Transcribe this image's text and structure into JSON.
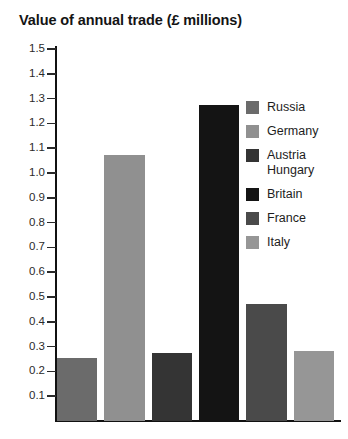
{
  "chart_data": {
    "type": "bar",
    "title": "Value of annual trade (£ millions)",
    "xlabel": "",
    "ylabel": "",
    "ylim": [
      0,
      1.5
    ],
    "ytick_step": 0.1,
    "grid": false,
    "legend_position": "right",
    "categories": [
      "Russia",
      "Germany",
      "Austria Hungary",
      "Britain",
      "France",
      "Italy"
    ],
    "values": [
      0.18,
      1.0,
      0.2,
      1.2,
      0.4,
      0.21
    ],
    "ytick_labels": [
      "1.5",
      "1.4",
      "1.3",
      "1.2",
      "1.1",
      "1.0",
      "0.9",
      "0.8",
      "0.7",
      "0.6",
      "0.5",
      "0.4",
      "0.3",
      "0.2",
      "0.1"
    ],
    "colors": [
      "#6b6b6b",
      "#909090",
      "#343434",
      "#141414",
      "#4a4a4a",
      "#969696"
    ],
    "series": [
      {
        "name": "Russia",
        "value": 0.18,
        "color": "#6b6b6b"
      },
      {
        "name": "Germany",
        "value": 1.0,
        "color": "#909090"
      },
      {
        "name": "Austria Hungary",
        "value": 0.2,
        "color": "#343434"
      },
      {
        "name": "Britain",
        "value": 1.2,
        "color": "#141414"
      },
      {
        "name": "France",
        "value": 0.4,
        "color": "#4a4a4a"
      },
      {
        "name": "Italy",
        "value": 0.21,
        "color": "#969696"
      }
    ]
  },
  "legend": {
    "items": [
      {
        "label": "Russia",
        "color": "#6b6b6b"
      },
      {
        "label": "Germany",
        "color": "#909090"
      },
      {
        "label": "Austria\nHungary",
        "color": "#343434"
      },
      {
        "label": "Britain",
        "color": "#141414"
      },
      {
        "label": "France",
        "color": "#4a4a4a"
      },
      {
        "label": "Italy",
        "color": "#969696"
      }
    ]
  }
}
